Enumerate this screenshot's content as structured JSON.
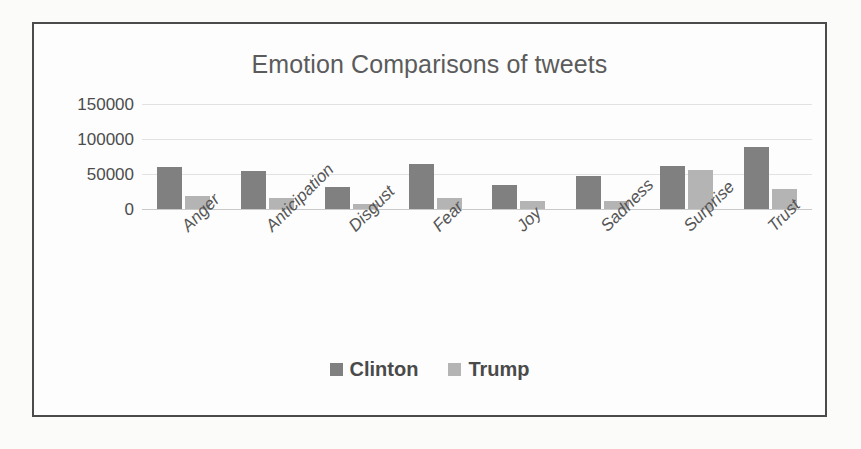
{
  "chart_data": {
    "type": "bar",
    "title": "Emotion Comparisons of tweets",
    "xlabel": "",
    "ylabel": "",
    "categories": [
      "Anger",
      "Anticipation",
      "Disgust",
      "Fear",
      "Joy",
      "Sadness",
      "Surprise",
      "Trust"
    ],
    "series": [
      {
        "name": "Clinton",
        "color": "#808080",
        "values": [
          60000,
          55000,
          31000,
          64000,
          35000,
          47000,
          61000,
          88000
        ]
      },
      {
        "name": "Trump",
        "color": "#b4b4b4",
        "values": [
          19000,
          16000,
          7000,
          16000,
          11000,
          11000,
          56000,
          29000
        ]
      }
    ],
    "ylim": [
      0,
      150000
    ],
    "yticks": [
      "150000",
      "100000",
      "50000",
      "0"
    ],
    "ytick_values": [
      150000,
      100000,
      50000,
      0
    ],
    "grid": true,
    "legend_position": "bottom"
  },
  "legend": {
    "items": [
      {
        "label": "Clinton",
        "swatch": "legend-swatch-clinton"
      },
      {
        "label": "Trump",
        "swatch": "legend-swatch-trump"
      }
    ]
  }
}
